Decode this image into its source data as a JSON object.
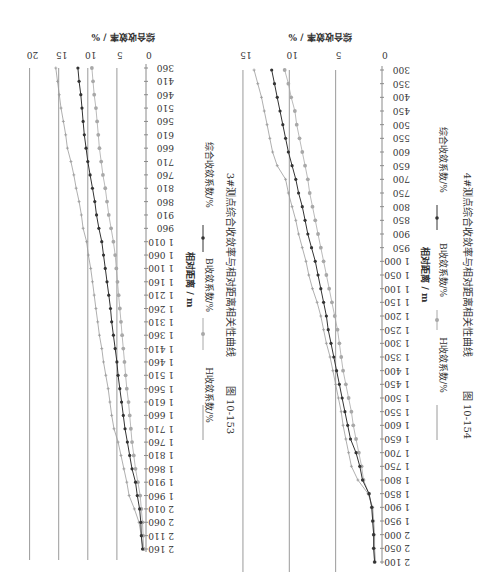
{
  "chart_data": [
    {
      "type": "line",
      "figure_number": "图 10-153",
      "title": "3#测点综合收敛率与相对距离相关性曲线",
      "xlabel": "相对距离 / m",
      "ylabel": "综合收敛率 / %",
      "ylim": [
        0,
        20
      ],
      "yticks": [
        0,
        5,
        10,
        15,
        20
      ],
      "grid": true,
      "legend_position": "bottom",
      "orientation_note": "page rotated 90° clockwise",
      "categories": [
        "360",
        "410",
        "460",
        "510",
        "560",
        "610",
        "660",
        "710",
        "760",
        "810",
        "860",
        "910",
        "960",
        "1 010",
        "1 060",
        "1 100",
        "1 160",
        "1 210",
        "1 260",
        "1 310",
        "1 360",
        "1 410",
        "1 460",
        "1 510",
        "1 560",
        "1 610",
        "1 660",
        "1 710",
        "1 760",
        "1 810",
        "1 860",
        "1 910",
        "1 960",
        "2 010",
        "2 060",
        "2 110",
        "2 160"
      ],
      "series": [
        {
          "name": "H收敛系数/%",
          "marker": "small-plus",
          "color": "#9a9a9a",
          "values": [
            15.5,
            15.2,
            14.9,
            14.6,
            14.2,
            13.8,
            13.5,
            12.9,
            12.4,
            12.0,
            11.5,
            11.1,
            10.8,
            10.2,
            9.9,
            9.5,
            9.2,
            8.9,
            8.6,
            8.3,
            8.0,
            7.6,
            7.3,
            6.9,
            6.5,
            6.2,
            5.9,
            5.5,
            4.8,
            4.3,
            3.8,
            3.3,
            2.9,
            2.0,
            1.2,
            0.8,
            0.5
          ]
        },
        {
          "name": "B收敛系数/%",
          "marker": "circle",
          "color": "#a8a8a8",
          "values": [
            9.3,
            9.1,
            8.9,
            8.6,
            8.4,
            8.2,
            8.0,
            7.7,
            7.4,
            7.0,
            6.7,
            6.4,
            6.0,
            5.6,
            5.3,
            5.1,
            4.9,
            4.7,
            4.5,
            4.3,
            4.1,
            3.9,
            3.7,
            3.5,
            3.3,
            3.0,
            2.8,
            2.6,
            2.4,
            2.1,
            1.8,
            1.4,
            1.0,
            0.8,
            0.6,
            0.5,
            0.4
          ]
        },
        {
          "name": "综合收敛系数/%",
          "marker": "filled-dot",
          "color": "#333333",
          "values": [
            11.7,
            11.5,
            11.2,
            11.0,
            10.8,
            10.6,
            10.3,
            10.0,
            9.6,
            9.2,
            8.8,
            8.5,
            8.1,
            7.6,
            7.3,
            7.0,
            6.7,
            6.4,
            6.1,
            5.9,
            5.6,
            5.3,
            5.0,
            4.8,
            4.5,
            4.2,
            3.9,
            3.6,
            3.2,
            2.8,
            2.4,
            1.8,
            1.5,
            1.1,
            0.9,
            0.8,
            0.6
          ]
        }
      ]
    },
    {
      "type": "line",
      "figure_number": "图 10-154",
      "title": "4#测点综合收敛率与相对距离相关性曲线",
      "xlabel": "相对距离 / m",
      "ylabel": "综合收敛率 / %",
      "ylim": [
        0,
        15
      ],
      "yticks": [
        0,
        5,
        10,
        15
      ],
      "grid": true,
      "legend_position": "bottom",
      "orientation_note": "page rotated 90° clockwise",
      "categories": [
        "300",
        "350",
        "400",
        "450",
        "500",
        "550",
        "600",
        "650",
        "700",
        "750",
        "800",
        "850",
        "900",
        "950",
        "1 000",
        "1 050",
        "1 100",
        "1 150",
        "1 200",
        "1 250",
        "1 300",
        "1 350",
        "1 400",
        "1 450",
        "1 500",
        "1 550",
        "1 600",
        "1 650",
        "1 700",
        "1 750",
        "1 800",
        "1 850",
        "1 900",
        "1 950",
        "2 000",
        "2 050",
        "2 100"
      ],
      "series": [
        {
          "name": "H收敛系数/%",
          "marker": "small-plus",
          "color": "#9a9a9a",
          "values": [
            13.8,
            13.4,
            13.0,
            12.7,
            12.4,
            12.1,
            11.8,
            11.3,
            10.4,
            10.1,
            9.7,
            9.3,
            9.0,
            8.6,
            8.2,
            7.9,
            7.5,
            7.0,
            6.6,
            6.3,
            6.0,
            5.6,
            5.3,
            5.0,
            4.7,
            4.4,
            4.2,
            3.9,
            3.6,
            3.3,
            2.6,
            1.5,
            1.0,
            0.9,
            0.8,
            0.8,
            0.7
          ]
        },
        {
          "name": "B收敛系数/%",
          "marker": "circle",
          "color": "#a8a8a8",
          "values": [
            10.5,
            10.1,
            9.8,
            9.4,
            9.2,
            8.9,
            8.6,
            8.3,
            8.0,
            7.8,
            7.5,
            7.2,
            6.9,
            6.6,
            6.3,
            6.0,
            5.7,
            5.4,
            5.1,
            4.8,
            4.6,
            4.4,
            4.2,
            3.9,
            3.6,
            3.3,
            3.1,
            2.8,
            2.5,
            2.2,
            2.0,
            1.4,
            1.1,
            1.0,
            0.9,
            0.9,
            0.8
          ]
        },
        {
          "name": "综合收敛系数/%",
          "marker": "filled-dot",
          "color": "#333333",
          "values": [
            11.9,
            11.6,
            11.3,
            11.0,
            10.7,
            10.4,
            10.1,
            9.7,
            9.3,
            9.0,
            8.6,
            8.3,
            8.0,
            7.6,
            7.2,
            6.9,
            6.6,
            6.3,
            6.0,
            5.8,
            5.5,
            5.2,
            4.9,
            4.6,
            4.3,
            4.0,
            3.7,
            3.4,
            2.8,
            2.4,
            2.1,
            1.4,
            1.1,
            1.0,
            0.9,
            0.9,
            0.8
          ]
        }
      ]
    }
  ],
  "figures": [
    {
      "ylabel": "综合收敛率 / %",
      "xlabel": "相对距离 / m",
      "legend": [
        "H收敛系数/%",
        "B收敛系数/%",
        "综合收敛系数/%"
      ],
      "caption_number": "图 10-153",
      "caption_text": "3#测点综合收敛率与相对距离相关性曲线"
    },
    {
      "ylabel": "综合收敛率 / %",
      "xlabel": "相对距离 / m",
      "legend": [
        "H收敛系数/%",
        "B收敛系数/%",
        "综合收敛系数/%"
      ],
      "caption_number": "图 10-154",
      "caption_text": "4#测点综合收敛率与相对距离相关性曲线"
    }
  ]
}
